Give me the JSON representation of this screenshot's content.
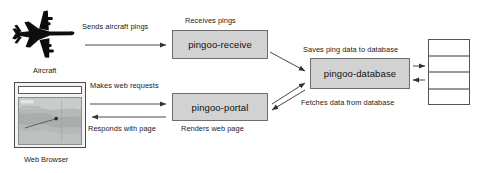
{
  "diagram": {
    "background_color": "#ffffff",
    "box_fill_color": "#d2d2d2",
    "box_border_color": "#6e6e6e",
    "arrow_color": "#333333"
  },
  "nodes": {
    "aircraft": {
      "caption": "Aircraft",
      "icon": "airplane-icon"
    },
    "web_browser": {
      "caption": "Web Browser",
      "icon": "browser-window-icon",
      "url_value": "",
      "url_placeholder": ""
    },
    "pingoo_receive": {
      "label": "pingoo-receive",
      "top_label": "Receives pings"
    },
    "pingoo_portal": {
      "label": "pingoo-portal",
      "bottom_label": "Renders web page"
    },
    "pingoo_database": {
      "label": "pingoo-database",
      "top_label": "Saves ping data to database",
      "bottom_label": "Fetches data from database"
    },
    "database_store": {
      "icon": "database-table-icon",
      "row_count": 4
    }
  },
  "edges": {
    "aircraft_to_receive": "Sends aircraft pings",
    "browser_to_portal": "Makes web requests",
    "portal_to_browser": "Responds with page"
  }
}
